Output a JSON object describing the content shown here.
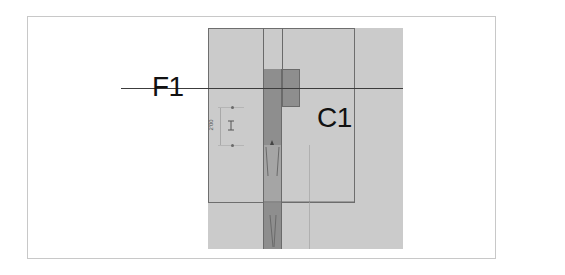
{
  "diagram": {
    "type": "architectural-plan-detail",
    "labels": {
      "gridline": "F1",
      "column": "C1"
    },
    "dimension": {
      "text": "2'00",
      "orientation": "vertical"
    },
    "colors": {
      "background": "#ffffff",
      "frame_border": "#c8c8c8",
      "light_zone": "#cbcbcb",
      "dark_member": "#8e8e8e",
      "line": "#3c3c3c",
      "text": "#111111"
    }
  }
}
